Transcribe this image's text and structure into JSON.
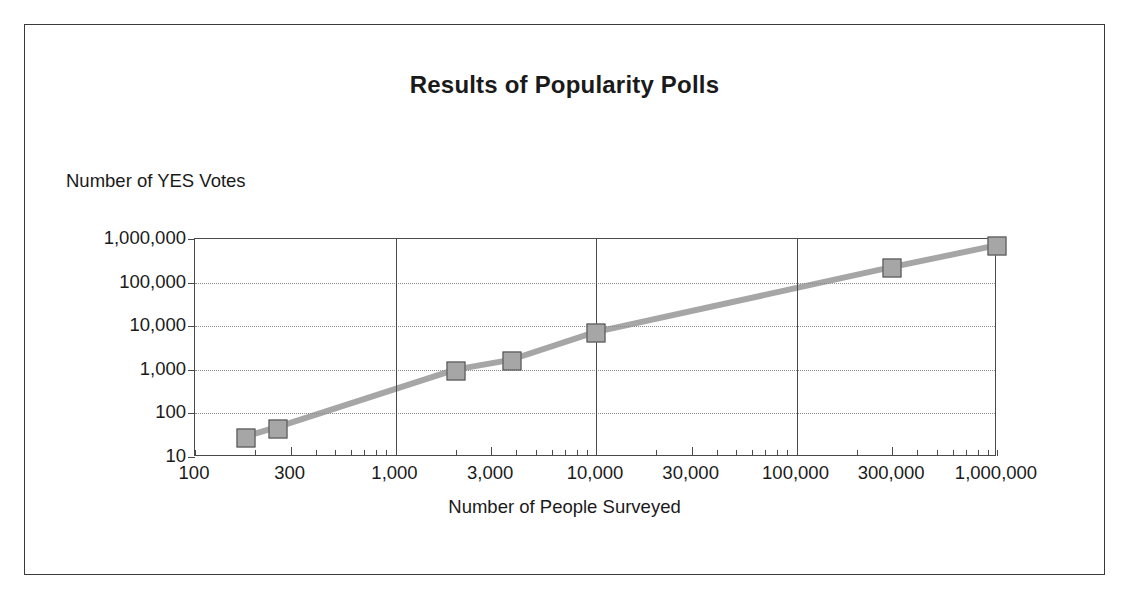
{
  "chart_data": {
    "type": "scatter",
    "title": "Results of Popularity Polls",
    "xlabel": "Number of People Surveyed",
    "ylabel": "Number of YES Votes",
    "xscale": "log",
    "yscale": "log",
    "xlim": [
      100,
      1000000
    ],
    "ylim": [
      10,
      1000000
    ],
    "grid": "major vertical solid, major horizontal dotted",
    "legend": "none",
    "marker_style": "square",
    "marker_color": "#a6a6a6",
    "line_color": "#a6a6a6",
    "x_tick_labels": [
      "100",
      "300",
      "1,000",
      "3,000",
      "10,000",
      "30,000",
      "100,000",
      "300,000",
      "1,000,000"
    ],
    "x_tick_values": [
      100,
      300,
      1000,
      3000,
      10000,
      30000,
      100000,
      300000,
      1000000
    ],
    "y_tick_labels": [
      "1,000,000",
      "100,000",
      "10,000",
      "1,000",
      "100",
      "10"
    ],
    "y_tick_values": [
      1000000,
      100000,
      10000,
      1000,
      100,
      10
    ],
    "x": [
      180,
      260,
      2000,
      3800,
      10000,
      300000,
      1000000
    ],
    "y": [
      27,
      45,
      950,
      1600,
      7000,
      220000,
      700000
    ],
    "points": [
      {
        "x": 180,
        "y": 27
      },
      {
        "x": 260,
        "y": 45
      },
      {
        "x": 2000,
        "y": 950
      },
      {
        "x": 3800,
        "y": 1600
      },
      {
        "x": 10000,
        "y": 7000
      },
      {
        "x": 300000,
        "y": 220000
      },
      {
        "x": 1000000,
        "y": 700000
      }
    ]
  },
  "figure": {
    "title": "Results of Popularity Polls",
    "x_axis_title": "Number of People Surveyed",
    "y_axis_title": "Number of YES Votes"
  },
  "colors": {
    "frame": "#3a3a3a",
    "axis": "#4a4a4a",
    "gridline": "#8d8d8d",
    "marker_fill": "#a6a6a6",
    "marker_edge": "#4a4a4a",
    "text": "#1a1a1a",
    "background": "#ffffff"
  }
}
